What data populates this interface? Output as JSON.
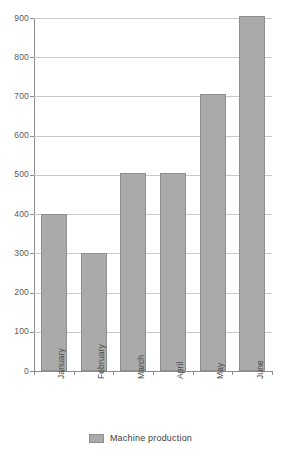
{
  "chart_data": {
    "type": "bar",
    "title": "",
    "subtitle": "",
    "xlabel": "",
    "ylabel": "",
    "categories": [
      "January",
      "February",
      "March",
      "April",
      "May",
      "June"
    ],
    "series": [
      {
        "name": "Machine production",
        "values": [
          400,
          300,
          505,
          505,
          705,
          905
        ],
        "color": "#AAAAAA"
      }
    ],
    "values": [
      400,
      300,
      505,
      505,
      705,
      905
    ],
    "ylim": [
      0,
      900
    ],
    "ytick_labels": [
      "900",
      "800",
      "700",
      "600",
      "500",
      "400",
      "300",
      "200",
      "100",
      "0"
    ],
    "ytick_values": [
      900,
      800,
      700,
      600,
      500,
      400,
      300,
      200,
      100,
      0
    ],
    "ytick_step": 100,
    "grid": true,
    "grid_axis": "y",
    "legend": {
      "position": "bottom",
      "entries": [
        {
          "label": "Machine production",
          "color": "#AAAAAA"
        }
      ]
    },
    "annotations": [],
    "colors": {
      "bar_fill": "#AAAAAA",
      "bar_border": "#8F8F8F",
      "gridline": "#C9C9C9",
      "axis_line": "#8C8C8C",
      "text": "#4A4A4A",
      "background": "#FFFFFF"
    },
    "xlabel_rotation": -90
  }
}
